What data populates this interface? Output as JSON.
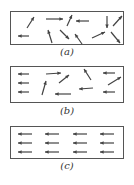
{
  "figure": {
    "panels": [
      {
        "id": "a",
        "label": "(a)",
        "description": "random orientation",
        "arrows": [
          {
            "x1": 16,
            "y1": 16,
            "x2": 23,
            "y2": 5
          },
          {
            "x1": 35,
            "y1": 7,
            "x2": 52,
            "y2": 7
          },
          {
            "x1": 56,
            "y1": 14,
            "x2": 61,
            "y2": 3
          },
          {
            "x1": 78,
            "y1": 9,
            "x2": 65,
            "y2": 9
          },
          {
            "x1": 96,
            "y1": 4,
            "x2": 96,
            "y2": 16
          },
          {
            "x1": 102,
            "y1": 14,
            "x2": 111,
            "y2": 4
          },
          {
            "x1": 18,
            "y1": 24,
            "x2": 7,
            "y2": 24
          },
          {
            "x1": 41,
            "y1": 31,
            "x2": 37,
            "y2": 18
          },
          {
            "x1": 49,
            "y1": 18,
            "x2": 58,
            "y2": 27
          },
          {
            "x1": 71,
            "y1": 32,
            "x2": 64,
            "y2": 22
          },
          {
            "x1": 81,
            "y1": 26,
            "x2": 94,
            "y2": 20
          },
          {
            "x1": 100,
            "y1": 20,
            "x2": 109,
            "y2": 31
          }
        ]
      },
      {
        "id": "b",
        "label": "(b)",
        "description": "partial alignment",
        "arrows": [
          {
            "x1": 18,
            "y1": 7,
            "x2": 7,
            "y2": 7
          },
          {
            "x1": 18,
            "y1": 16,
            "x2": 7,
            "y2": 16
          },
          {
            "x1": 18,
            "y1": 25,
            "x2": 7,
            "y2": 25
          },
          {
            "x1": 35,
            "y1": 7,
            "x2": 50,
            "y2": 6
          },
          {
            "x1": 31,
            "y1": 28,
            "x2": 35,
            "y2": 14
          },
          {
            "x1": 48,
            "y1": 16,
            "x2": 58,
            "y2": 8
          },
          {
            "x1": 60,
            "y1": 27,
            "x2": 44,
            "y2": 27
          },
          {
            "x1": 80,
            "y1": 13,
            "x2": 73,
            "y2": 2
          },
          {
            "x1": 82,
            "y1": 21,
            "x2": 68,
            "y2": 22
          },
          {
            "x1": 104,
            "y1": 6,
            "x2": 92,
            "y2": 6
          },
          {
            "x1": 97,
            "y1": 18,
            "x2": 110,
            "y2": 10
          },
          {
            "x1": 104,
            "y1": 25,
            "x2": 92,
            "y2": 25
          }
        ]
      },
      {
        "id": "c",
        "label": "(c)",
        "description": "full alignment",
        "arrows": [
          {
            "x1": 21,
            "y1": 7,
            "x2": 7,
            "y2": 7
          },
          {
            "x1": 48,
            "y1": 7,
            "x2": 34,
            "y2": 7
          },
          {
            "x1": 76,
            "y1": 7,
            "x2": 62,
            "y2": 7
          },
          {
            "x1": 103,
            "y1": 7,
            "x2": 89,
            "y2": 7
          },
          {
            "x1": 21,
            "y1": 16,
            "x2": 7,
            "y2": 16
          },
          {
            "x1": 48,
            "y1": 16,
            "x2": 34,
            "y2": 16
          },
          {
            "x1": 76,
            "y1": 16,
            "x2": 62,
            "y2": 16
          },
          {
            "x1": 103,
            "y1": 16,
            "x2": 89,
            "y2": 16
          },
          {
            "x1": 21,
            "y1": 25,
            "x2": 7,
            "y2": 25
          },
          {
            "x1": 48,
            "y1": 25,
            "x2": 34,
            "y2": 25
          },
          {
            "x1": 76,
            "y1": 25,
            "x2": 62,
            "y2": 25
          },
          {
            "x1": 103,
            "y1": 25,
            "x2": 89,
            "y2": 25
          }
        ]
      }
    ],
    "colors": {
      "stroke": "#444444",
      "border": "#555555"
    }
  }
}
